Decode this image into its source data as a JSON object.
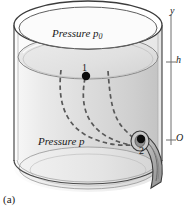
{
  "figure": {
    "caption": "(a)",
    "labels": {
      "pressure_top": "Pressure p",
      "pressure_top_subscript": "0",
      "pressure_bottom": "Pressure p",
      "point_1": "1",
      "point_2": "2"
    },
    "axis": {
      "name": "y",
      "tick_h": "h",
      "tick_origin": "O"
    },
    "colors": {
      "outline": "#3c3c3c",
      "liquid_light": "#efefef",
      "liquid_dark": "#c8c8c8",
      "surface_fill": "#e3e3e3",
      "streamline": "#5a5a5a",
      "marker": "#111111",
      "axis": "#6b6b6b",
      "spout": "#b5b5b5",
      "text": "#1a1a1a"
    }
  }
}
